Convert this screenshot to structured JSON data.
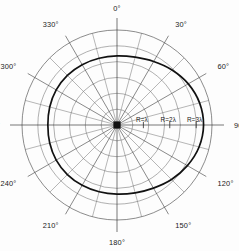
{
  "figure": {
    "center_marker": "center-dot"
  },
  "chart_data": {
    "type": "line",
    "coordinate_system": "polar",
    "title": "",
    "xlabel": "",
    "ylabel": "",
    "grid": true,
    "legend": false,
    "angle_unit": "degrees",
    "angle_direction": "clockwise-from-top",
    "angle_tick_step": 15,
    "angle_label_step": 30,
    "angle_labels": [
      "0°",
      "30°",
      "60°",
      "90°",
      "120°",
      "150°",
      "180°",
      "210°",
      "240°",
      "270°",
      "300°",
      "330°"
    ],
    "angle_label_values": [
      0,
      30,
      60,
      90,
      120,
      150,
      180,
      210,
      240,
      270,
      300,
      330
    ],
    "radial_rings": 6,
    "radial_labels": [
      "R=λ",
      "R=2λ",
      "R=3λ"
    ],
    "radial_label_values": [
      1,
      2,
      3
    ],
    "radial_label_angle": 90,
    "rlim": [
      0,
      3.6
    ],
    "series": [
      {
        "name": "pattern",
        "theta": [
          0,
          15,
          30,
          45,
          60,
          75,
          90,
          105,
          120,
          135,
          150,
          165,
          180,
          195,
          210,
          225,
          240,
          255,
          270,
          285,
          300,
          315,
          330,
          345
        ],
        "r": [
          2.62,
          2.66,
          2.78,
          2.95,
          3.12,
          3.24,
          3.28,
          3.22,
          3.08,
          2.92,
          2.76,
          2.66,
          2.62,
          2.62,
          2.64,
          2.66,
          2.66,
          2.64,
          2.62,
          2.64,
          2.66,
          2.66,
          2.64,
          2.62
        ]
      }
    ]
  },
  "colors": {
    "curve": "#111111",
    "grid": "#6e6e6e",
    "axis": "#3c3c3c",
    "text": "#1a1a1a",
    "background": "#fdfdfd"
  }
}
